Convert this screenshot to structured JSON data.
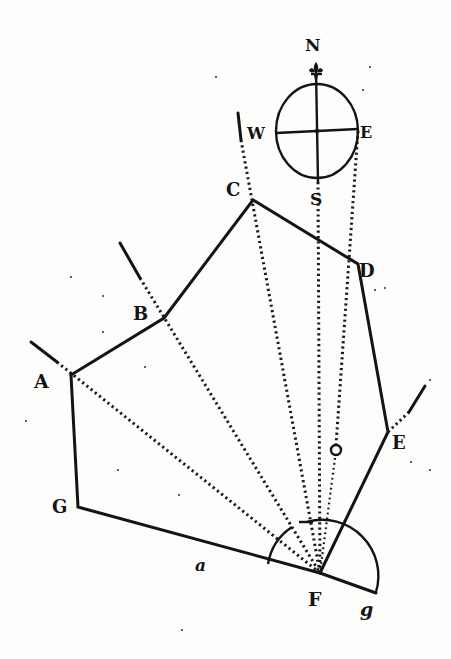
{
  "figure": {
    "compass": {
      "north": "N",
      "south": "S",
      "east": "E",
      "west": "W"
    },
    "stations": {
      "A": "A",
      "B": "B",
      "C": "C",
      "D": "D",
      "E": "E",
      "F": "F",
      "G": "G"
    },
    "auxiliary_labels": {
      "a": "a",
      "g": "g",
      "o": "o"
    }
  },
  "colors": {
    "ink": "#141414",
    "paper": "#fdfdfb"
  }
}
